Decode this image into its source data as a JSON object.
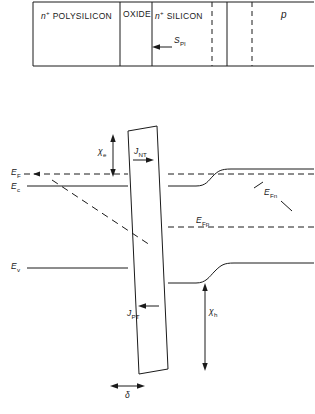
{
  "figure": {
    "type": "schematic-band-diagram"
  },
  "top_structure": {
    "regions": [
      {
        "id": "polysilicon",
        "label_html": "n+ POLYSILICON",
        "label_main": "POLYSILICON",
        "superscript": "+",
        "prefix": "n"
      },
      {
        "id": "oxide",
        "label_main": "OXIDE"
      },
      {
        "id": "n-silicon",
        "label_main": "SILICON",
        "superscript": "+",
        "prefix": "n"
      },
      {
        "id": "p-region",
        "label_main": "p"
      }
    ],
    "current_label": {
      "symbol": "S",
      "subscript": "PI",
      "arrow": "left"
    }
  },
  "band_diagram": {
    "left_labels": [
      {
        "id": "EF",
        "symbol": "E",
        "subscript": "F"
      },
      {
        "id": "Ec",
        "symbol": "E",
        "subscript": "c"
      },
      {
        "id": "Ev",
        "symbol": "E",
        "subscript": "v"
      }
    ],
    "right_labels": [
      {
        "id": "EFn",
        "symbol": "E",
        "subscript": "Fn"
      },
      {
        "id": "EFp",
        "symbol": "E",
        "subscript": "Fp"
      }
    ],
    "barrier_labels": [
      {
        "id": "chi_e",
        "symbol": "χ",
        "subscript": "e",
        "arrow": "vertical-double"
      },
      {
        "id": "chi_h",
        "symbol": "χ",
        "subscript": "h",
        "arrow": "vertical-double"
      },
      {
        "id": "J_NT",
        "symbol": "J",
        "subscript": "NT",
        "arrow": "right"
      },
      {
        "id": "J_PT",
        "symbol": "J",
        "subscript": "PT",
        "arrow": "left"
      },
      {
        "id": "delta",
        "symbol": "δ",
        "arrow": "horizontal-double"
      }
    ]
  },
  "colors": {
    "line": "#1a1a1a",
    "background": "#ffffff"
  }
}
